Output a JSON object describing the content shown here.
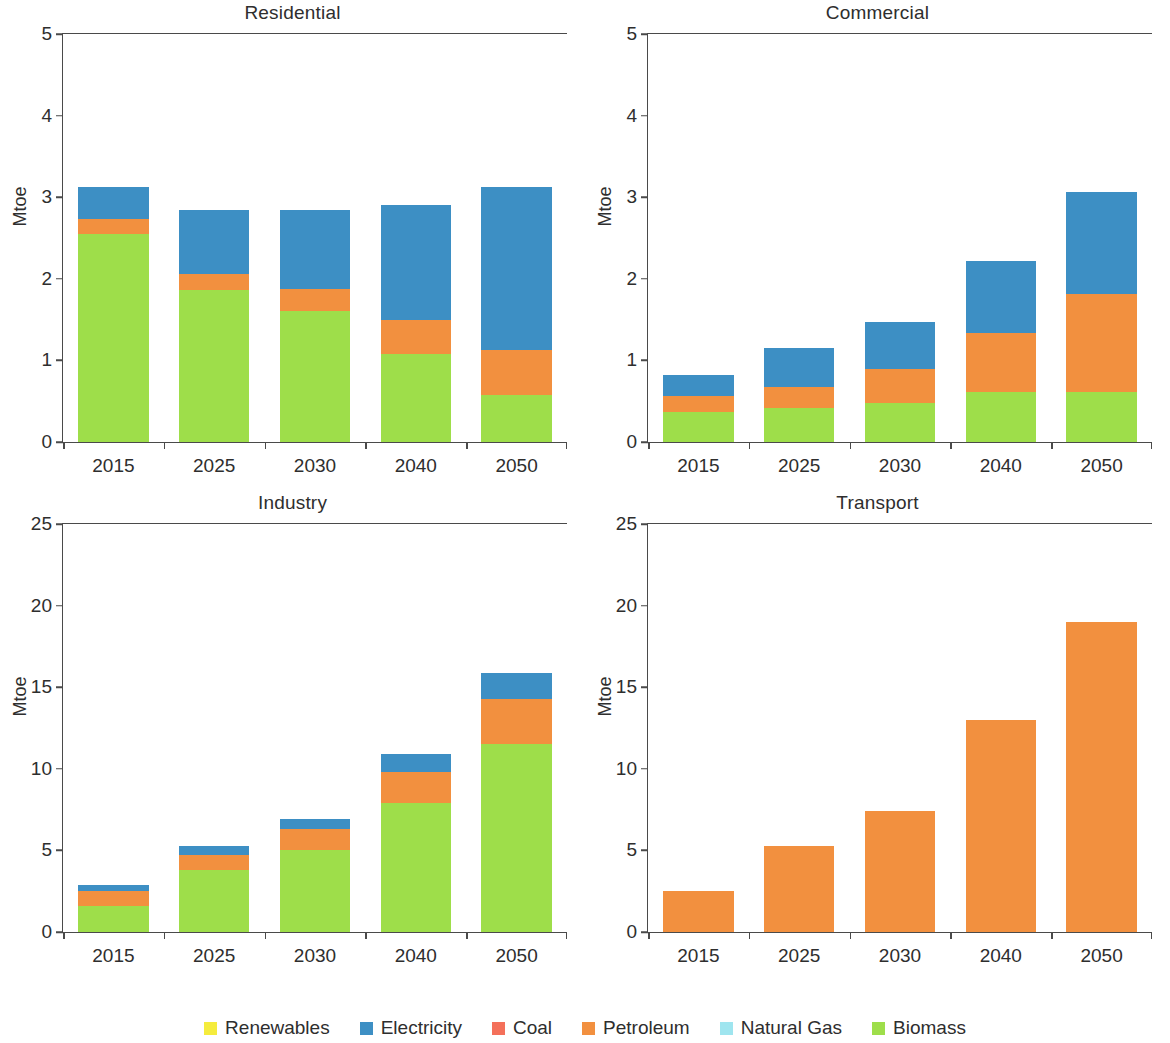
{
  "figure": {
    "ylabel": "Mtoe",
    "categories": [
      "2015",
      "2025",
      "2030",
      "2040",
      "2050"
    ]
  },
  "legend": {
    "items": [
      {
        "label": "Renewables",
        "color": "#f5ec3d"
      },
      {
        "label": "Electricity",
        "color": "#3d8fc4"
      },
      {
        "label": "Coal",
        "color": "#f4705a"
      },
      {
        "label": "Petroleum",
        "color": "#f2903f"
      },
      {
        "label": "Natural Gas",
        "color": "#9fe5ef"
      },
      {
        "label": "Biomass",
        "color": "#9ede4a"
      }
    ]
  },
  "chart_data": [
    {
      "type": "bar",
      "stacked": true,
      "title": "Residential",
      "xlabel": "",
      "ylabel": "Mtoe",
      "ylim": [
        0,
        5
      ],
      "yticks": [
        0,
        1,
        2,
        3,
        4,
        5
      ],
      "ytick_labels": [
        "0",
        "1",
        "2",
        "3",
        "4",
        "5"
      ],
      "grid": false,
      "legend_position": "bottom",
      "categories": [
        "2015",
        "2025",
        "2030",
        "2040",
        "2050"
      ],
      "series": [
        {
          "name": "Renewables",
          "color": "#f5ec3d",
          "values": [
            0,
            0,
            0,
            0,
            0
          ]
        },
        {
          "name": "Biomass",
          "color": "#9ede4a",
          "values": [
            2.55,
            1.86,
            1.61,
            1.08,
            0.58
          ]
        },
        {
          "name": "Natural Gas",
          "color": "#9fe5ef",
          "values": [
            0,
            0,
            0,
            0,
            0
          ]
        },
        {
          "name": "Petroleum",
          "color": "#f2903f",
          "values": [
            0.18,
            0.2,
            0.27,
            0.42,
            0.55
          ]
        },
        {
          "name": "Coal",
          "color": "#f4705a",
          "values": [
            0,
            0,
            0,
            0,
            0
          ]
        },
        {
          "name": "Electricity",
          "color": "#3d8fc4",
          "values": [
            0.39,
            0.78,
            0.96,
            1.41,
            1.99
          ]
        }
      ],
      "totals": [
        3.12,
        2.84,
        2.84,
        2.91,
        3.12
      ]
    },
    {
      "type": "bar",
      "stacked": true,
      "title": "Commercial",
      "xlabel": "",
      "ylabel": "Mtoe",
      "ylim": [
        0,
        5
      ],
      "yticks": [
        0,
        1,
        2,
        3,
        4,
        5
      ],
      "ytick_labels": [
        "0",
        "1",
        "2",
        "3",
        "4",
        "5"
      ],
      "grid": false,
      "legend_position": "bottom",
      "categories": [
        "2015",
        "2025",
        "2030",
        "2040",
        "2050"
      ],
      "series": [
        {
          "name": "Renewables",
          "color": "#f5ec3d",
          "values": [
            0,
            0,
            0,
            0,
            0
          ]
        },
        {
          "name": "Biomass",
          "color": "#9ede4a",
          "values": [
            0.37,
            0.42,
            0.48,
            0.61,
            0.61
          ]
        },
        {
          "name": "Natural Gas",
          "color": "#9fe5ef",
          "values": [
            0,
            0,
            0,
            0,
            0
          ]
        },
        {
          "name": "Petroleum",
          "color": "#f2903f",
          "values": [
            0.19,
            0.26,
            0.41,
            0.72,
            1.2
          ]
        },
        {
          "name": "Coal",
          "color": "#f4705a",
          "values": [
            0,
            0,
            0,
            0,
            0
          ]
        },
        {
          "name": "Electricity",
          "color": "#3d8fc4",
          "values": [
            0.26,
            0.47,
            0.58,
            0.89,
            1.26
          ]
        }
      ],
      "totals": [
        0.82,
        1.15,
        1.47,
        2.22,
        3.07
      ]
    },
    {
      "type": "bar",
      "stacked": true,
      "title": "Industry",
      "xlabel": "",
      "ylabel": "Mtoe",
      "ylim": [
        0,
        25
      ],
      "yticks": [
        0,
        5,
        10,
        15,
        20,
        25
      ],
      "ytick_labels": [
        "0",
        "5",
        "10",
        "15",
        "20",
        "25"
      ],
      "grid": false,
      "legend_position": "bottom",
      "categories": [
        "2015",
        "2025",
        "2030",
        "2040",
        "2050"
      ],
      "series": [
        {
          "name": "Renewables",
          "color": "#f5ec3d",
          "values": [
            0,
            0,
            0,
            0,
            0
          ]
        },
        {
          "name": "Biomass",
          "color": "#9ede4a",
          "values": [
            1.6,
            3.8,
            5.0,
            7.9,
            11.5
          ]
        },
        {
          "name": "Natural Gas",
          "color": "#9fe5ef",
          "values": [
            0,
            0,
            0,
            0,
            0
          ]
        },
        {
          "name": "Petroleum",
          "color": "#f2903f",
          "values": [
            0.9,
            0.9,
            1.3,
            1.9,
            2.8
          ]
        },
        {
          "name": "Coal",
          "color": "#f4705a",
          "values": [
            0,
            0,
            0,
            0,
            0
          ]
        },
        {
          "name": "Electricity",
          "color": "#3d8fc4",
          "values": [
            0.4,
            0.6,
            0.6,
            1.1,
            1.6
          ]
        }
      ],
      "totals": [
        2.9,
        5.3,
        6.9,
        10.9,
        15.9
      ]
    },
    {
      "type": "bar",
      "stacked": true,
      "title": "Transport",
      "xlabel": "",
      "ylabel": "Mtoe",
      "ylim": [
        0,
        25
      ],
      "yticks": [
        0,
        5,
        10,
        15,
        20,
        25
      ],
      "ytick_labels": [
        "0",
        "5",
        "10",
        "15",
        "20",
        "25"
      ],
      "grid": false,
      "legend_position": "bottom",
      "categories": [
        "2015",
        "2025",
        "2030",
        "2040",
        "2050"
      ],
      "series": [
        {
          "name": "Renewables",
          "color": "#f5ec3d",
          "values": [
            0,
            0,
            0,
            0,
            0
          ]
        },
        {
          "name": "Biomass",
          "color": "#9ede4a",
          "values": [
            0,
            0,
            0,
            0,
            0
          ]
        },
        {
          "name": "Natural Gas",
          "color": "#9fe5ef",
          "values": [
            0,
            0,
            0,
            0,
            0
          ]
        },
        {
          "name": "Petroleum",
          "color": "#f2903f",
          "values": [
            2.5,
            5.3,
            7.4,
            13.0,
            19.0
          ]
        },
        {
          "name": "Coal",
          "color": "#f4705a",
          "values": [
            0,
            0,
            0,
            0,
            0
          ]
        },
        {
          "name": "Electricity",
          "color": "#3d8fc4",
          "values": [
            0,
            0,
            0,
            0,
            0
          ]
        }
      ],
      "totals": [
        2.5,
        5.3,
        7.4,
        13.0,
        19.0
      ]
    }
  ]
}
